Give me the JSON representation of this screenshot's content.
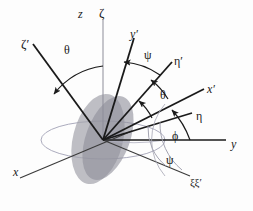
{
  "figure": {
    "background_color": "#fdfdfd",
    "line_color": "#1a1a1a",
    "thin_line_color": "#8a8a95",
    "disk_fill_color": "#9a9aa2",
    "disk_fill_color_2": "#8f8f99",
    "ellipse_outline_color": "#9b9bb0",
    "origin": {
      "x": 103,
      "y": 140
    }
  },
  "labels": {
    "z": {
      "text": "z",
      "x": 78,
      "y": 8,
      "size": "sz12"
    },
    "zeta": {
      "text": "ζ",
      "x": 99,
      "y": 7,
      "size": "sz13"
    },
    "zeta_p": {
      "text": "ζ′",
      "x": 21,
      "y": 37,
      "size": "sz13"
    },
    "theta_left": {
      "text": "θ",
      "x": 64,
      "y": 45,
      "size": "sz12"
    },
    "y_p": {
      "text": "y′",
      "x": 130,
      "y": 29,
      "size": "sz12"
    },
    "psi_top": {
      "text": "ψ",
      "x": 144,
      "y": 50,
      "size": "sz12"
    },
    "eta_p": {
      "text": "η′",
      "x": 174,
      "y": 56,
      "size": "sz12"
    },
    "x_p": {
      "text": "x′",
      "x": 207,
      "y": 84,
      "size": "sz12"
    },
    "theta_mid": {
      "text": "θ",
      "x": 160,
      "y": 90,
      "size": "sz12"
    },
    "eta": {
      "text": "η",
      "x": 196,
      "y": 111,
      "size": "sz12"
    },
    "phi": {
      "text": "ϕ",
      "x": 172,
      "y": 131,
      "size": "sz12"
    },
    "y": {
      "text": "y",
      "x": 231,
      "y": 139,
      "size": "sz12"
    },
    "psi_bot": {
      "text": "ψ",
      "x": 166,
      "y": 155,
      "size": "sz12"
    },
    "xi_xi_p": {
      "text": "ξξ′",
      "x": 190,
      "y": 178,
      "size": "sz11"
    },
    "x": {
      "text": "x",
      "x": 13,
      "y": 167,
      "size": "sz12"
    }
  },
  "axes": [
    {
      "name": "z-axis",
      "label": "z"
    },
    {
      "name": "zeta-axis",
      "label": "ζ"
    },
    {
      "name": "zeta-prime-axis",
      "label": "ζ′"
    },
    {
      "name": "y-prime-axis",
      "label": "y′"
    },
    {
      "name": "eta-prime-axis",
      "label": "η′"
    },
    {
      "name": "x-prime-axis",
      "label": "x′"
    },
    {
      "name": "eta-axis",
      "label": "η"
    },
    {
      "name": "y-axis",
      "label": "y"
    },
    {
      "name": "x-axis",
      "label": "x"
    },
    {
      "name": "xi-axis",
      "label": "ξξ′"
    }
  ],
  "angles": [
    {
      "name": "theta-left",
      "label": "θ",
      "between": [
        "z",
        "ζ′"
      ]
    },
    {
      "name": "psi-top",
      "label": "ψ",
      "between": [
        "y′",
        "η′"
      ]
    },
    {
      "name": "theta-mid",
      "label": "θ",
      "between": [
        "η′",
        "x′"
      ]
    },
    {
      "name": "phi",
      "label": "ϕ",
      "between": [
        "y",
        "η"
      ]
    },
    {
      "name": "psi-bottom",
      "label": "ψ",
      "between": [
        "y",
        "ξξ′"
      ]
    }
  ]
}
